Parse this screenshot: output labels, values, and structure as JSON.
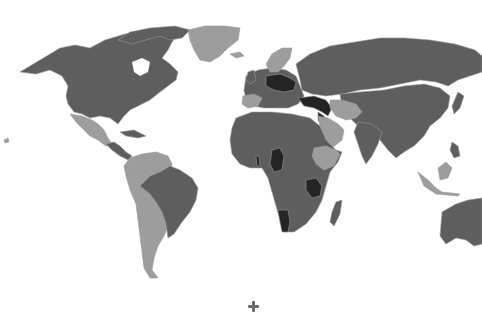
{
  "map": {
    "type": "choropleth-world-map",
    "palette": {
      "background": "#ffffff",
      "level_light": "#9d9d9d",
      "level_medium": "#5e5e5e",
      "level_dark": "#242424",
      "border": "#9a9a9a"
    },
    "legend": null,
    "regions": [
      {
        "name": "north-america",
        "level": "medium"
      },
      {
        "name": "greenland",
        "level": "light"
      },
      {
        "name": "mexico",
        "level": "light"
      },
      {
        "name": "central-america",
        "level": "medium"
      },
      {
        "name": "brazil",
        "level": "medium"
      },
      {
        "name": "rest-of-south-america",
        "level": "light"
      },
      {
        "name": "europe",
        "level": "medium"
      },
      {
        "name": "scandinavia",
        "level": "light"
      },
      {
        "name": "iberia",
        "level": "light"
      },
      {
        "name": "central-europe",
        "level": "dark"
      },
      {
        "name": "turkey-syria-iraq",
        "level": "dark"
      },
      {
        "name": "russia",
        "level": "medium"
      },
      {
        "name": "iran-afghanistan-arabia",
        "level": "light"
      },
      {
        "name": "asia",
        "level": "medium"
      },
      {
        "name": "africa",
        "level": "medium"
      },
      {
        "name": "ethiopia",
        "level": "light"
      },
      {
        "name": "cameroon-chad",
        "level": "dark"
      },
      {
        "name": "tanzania",
        "level": "dark"
      },
      {
        "name": "namibia",
        "level": "dark"
      },
      {
        "name": "madagascar",
        "level": "medium"
      },
      {
        "name": "australia",
        "level": "medium"
      },
      {
        "name": "indonesia-borneo",
        "level": "light"
      }
    ]
  },
  "marker": {
    "icon": "plus-icon"
  }
}
